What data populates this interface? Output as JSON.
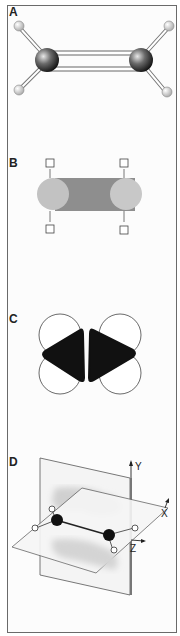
{
  "figure": {
    "panels": [
      {
        "id": "A",
        "label": "A",
        "description": "ball-and-stick model"
      },
      {
        "id": "B",
        "label": "B",
        "description": "sigma bond overlap"
      },
      {
        "id": "C",
        "label": "C",
        "description": "p orbitals"
      },
      {
        "id": "D",
        "label": "D",
        "description": "pi bond with nodal plane and axes"
      }
    ],
    "axes": {
      "y": "Y",
      "x": "X",
      "z": "Z"
    },
    "colors": {
      "frame": "#6a6a6a",
      "carbon": "#2a2a2a",
      "hydrogen": "#d8d8d8",
      "sigma_bond": "#8c8c8c",
      "sigma_lobe": "#bdbdbd",
      "p_orbital": "#111111",
      "pi_cloud": "#dcdcdc",
      "plane": "#f2f2f2"
    }
  }
}
